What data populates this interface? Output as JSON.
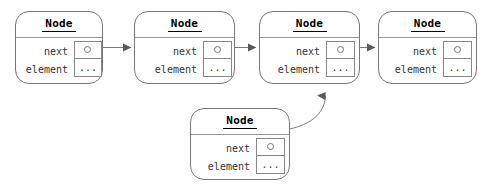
{
  "diagram": {
    "type": "linked-list-node-diagram",
    "background_color": "#ffffff",
    "stroke_color": "#777777",
    "text_color": "#000000",
    "nodes": [
      {
        "id": "node-1",
        "title": "Node",
        "x": 15,
        "y": 11,
        "width": 88,
        "height": 73,
        "fields": [
          {
            "label": "next",
            "value_kind": "reference-dot",
            "value_text": ""
          },
          {
            "label": "element",
            "value_kind": "ellipsis",
            "value_text": "..."
          }
        ],
        "has_outgoing_link": true
      },
      {
        "id": "node-2",
        "title": "Node",
        "x": 134,
        "y": 11,
        "width": 101,
        "height": 73,
        "fields": [
          {
            "label": "next",
            "value_kind": "reference-dot",
            "value_text": ""
          },
          {
            "label": "element",
            "value_kind": "ellipsis",
            "value_text": "..."
          }
        ],
        "has_outgoing_link": true
      },
      {
        "id": "node-3",
        "title": "Node",
        "x": 259,
        "y": 11,
        "width": 101,
        "height": 73,
        "fields": [
          {
            "label": "next",
            "value_kind": "reference-dot",
            "value_text": ""
          },
          {
            "label": "element",
            "value_kind": "ellipsis",
            "value_text": "..."
          }
        ],
        "has_outgoing_link": true
      },
      {
        "id": "node-4",
        "title": "Node",
        "x": 378,
        "y": 11,
        "width": 99,
        "height": 73,
        "fields": [
          {
            "label": "next",
            "value_kind": "reference-dot",
            "value_text": ""
          },
          {
            "label": "element",
            "value_kind": "ellipsis",
            "value_text": "..."
          }
        ],
        "has_outgoing_link": false
      },
      {
        "id": "node-5",
        "title": "Node",
        "x": 190,
        "y": 108,
        "width": 100,
        "height": 72,
        "fields": [
          {
            "label": "next",
            "value_kind": "reference-dot",
            "value_text": ""
          },
          {
            "label": "element",
            "value_kind": "ellipsis",
            "value_text": "..."
          }
        ],
        "has_outgoing_link": true
      }
    ],
    "edges": [
      {
        "id": "edge-1-to-2",
        "from": "node-1",
        "to": "node-2",
        "shape": "straight",
        "direction": "right"
      },
      {
        "id": "edge-2-to-3",
        "from": "node-2",
        "to": "node-3",
        "shape": "straight",
        "direction": "right"
      },
      {
        "id": "edge-3-to-4",
        "from": "node-3",
        "to": "node-4",
        "shape": "straight",
        "direction": "right"
      },
      {
        "id": "edge-5-to-3",
        "from": "node-5",
        "to": "node-3",
        "shape": "curved",
        "direction": "up"
      }
    ]
  }
}
